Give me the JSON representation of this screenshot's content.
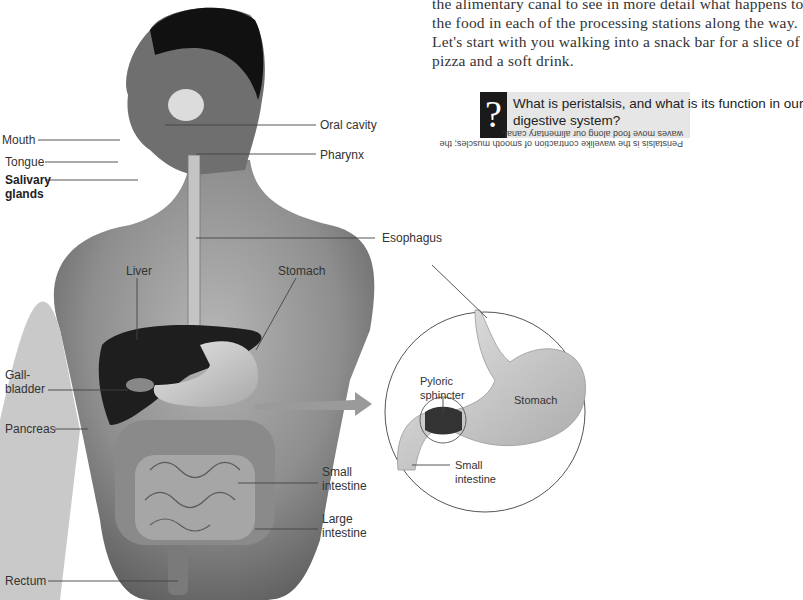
{
  "body_text": {
    "lines": [
      "the alimentary canal to see in more detail what happens to",
      "the food in each of the processing stations along the way.",
      "Let's start with you walking into a snack bar for a slice of",
      "pizza and a soft drink."
    ]
  },
  "question_box": {
    "icon": "question-mark-icon",
    "icon_glyph": "?",
    "question_lines": [
      "What is peristalsis, and what is its function in our",
      "digestive system?"
    ],
    "answer_upside_down": [
      "Peristalsis is the wavelike contraction of smooth muscles; the",
      "waves move food along our alimentary canal."
    ]
  },
  "figure": {
    "left_labels": {
      "mouth": "Mouth",
      "tongue": "Tongue",
      "salivary": [
        "Salivary",
        "glands"
      ],
      "gallbladder": [
        "Gall-",
        "bladder"
      ],
      "pancreas": "Pancreas",
      "rectum": "Rectum"
    },
    "right_labels": {
      "oral_cavity": "Oral cavity",
      "pharynx": "Pharynx",
      "esophagus": "Esophagus",
      "small_intestine": [
        "Small",
        "intestine"
      ],
      "large_intestine": [
        "Large",
        "intestine"
      ]
    },
    "body_labels": {
      "liver": "Liver",
      "stomach": "Stomach"
    },
    "inset_labels": {
      "pyloric": [
        "Pyloric",
        "sphincter"
      ],
      "stomach": "Stomach",
      "small_intestine": [
        "Small",
        "intestine"
      ]
    }
  }
}
